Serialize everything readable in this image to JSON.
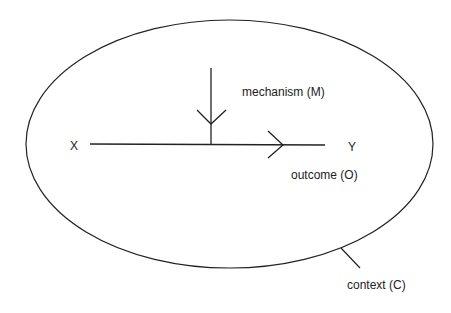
{
  "diagram": {
    "nodes": {
      "x": "X",
      "y": "Y"
    },
    "labels": {
      "mechanism": "mechanism (M)",
      "outcome": "outcome (O)",
      "context": "context (C)"
    },
    "colors": {
      "stroke": "#222222",
      "background": "#ffffff"
    }
  }
}
